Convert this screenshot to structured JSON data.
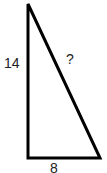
{
  "diagram": {
    "type": "right-triangle",
    "labels": {
      "vertical_leg": "14",
      "hypotenuse": "?",
      "horizontal_leg": "8"
    },
    "stroke_color": "#000000"
  }
}
